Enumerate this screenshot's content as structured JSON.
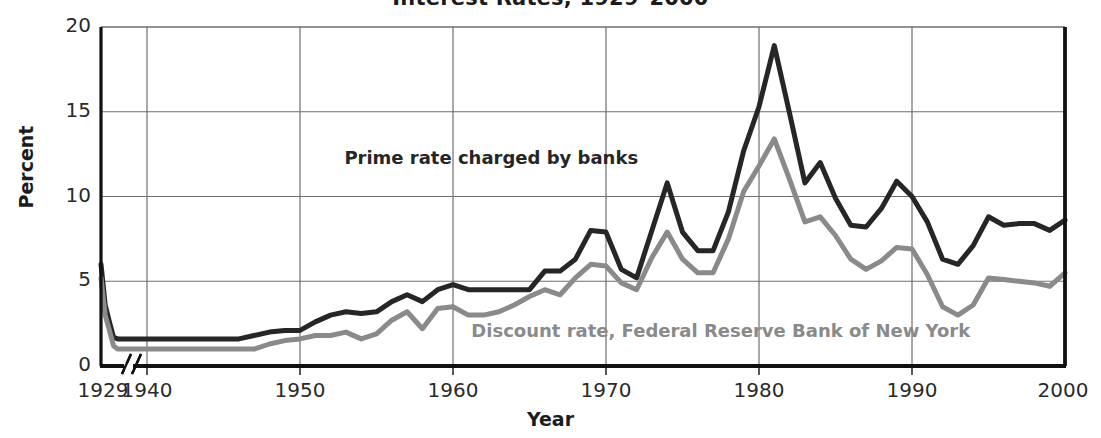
{
  "chart_data": {
    "type": "line",
    "title": "Interest Rates, 1929–2000",
    "xlabel": "Year",
    "ylabel": "Percent",
    "ylim": [
      0,
      20
    ],
    "xlim": [
      1929,
      2000
    ],
    "grid": true,
    "axis_break": true,
    "axis_break_note": "//",
    "legend_position": "inline-annotations",
    "y_ticks": [
      0,
      5,
      10,
      15,
      20
    ],
    "y_tick_labels": [
      "0",
      "5",
      "10",
      "15",
      "20"
    ],
    "x_ticks": [
      1929,
      1940,
      1950,
      1960,
      1970,
      1980,
      1990,
      2000
    ],
    "x_tick_labels": [
      "1929",
      "1940",
      "1950",
      "1960",
      "1970",
      "1980",
      "1990",
      "2000"
    ],
    "colors": {
      "prime": "#262626",
      "discount": "#8a8a8a",
      "grid": "#6e6e6e",
      "axis": "#111111"
    },
    "series": [
      {
        "name": "Prime rate charged by banks",
        "color": "#262626",
        "label_x": 1962.5,
        "label_y": 12.2,
        "x": [
          1929,
          1930,
          1931,
          1932,
          1933,
          1934,
          1940,
          1941,
          1942,
          1943,
          1944,
          1945,
          1946,
          1947,
          1948,
          1949,
          1950,
          1951,
          1952,
          1953,
          1954,
          1955,
          1956,
          1957,
          1958,
          1959,
          1960,
          1961,
          1962,
          1963,
          1964,
          1965,
          1966,
          1967,
          1968,
          1969,
          1970,
          1971,
          1972,
          1973,
          1974,
          1975,
          1976,
          1977,
          1978,
          1979,
          1980,
          1981,
          1982,
          1983,
          1984,
          1985,
          1986,
          1987,
          1988,
          1989,
          1990,
          1991,
          1992,
          1993,
          1994,
          1995,
          1996,
          1997,
          1998,
          1999,
          2000
        ],
        "y": [
          6.0,
          3.6,
          2.6,
          1.7,
          1.6,
          1.6,
          1.6,
          1.6,
          1.6,
          1.6,
          1.6,
          1.6,
          1.6,
          1.8,
          2.0,
          2.1,
          2.1,
          2.6,
          3.0,
          3.2,
          3.1,
          3.2,
          3.8,
          4.2,
          3.8,
          4.5,
          4.8,
          4.5,
          4.5,
          4.5,
          4.5,
          4.5,
          5.6,
          5.6,
          6.3,
          8.0,
          7.9,
          5.7,
          5.2,
          8.0,
          10.8,
          7.9,
          6.8,
          6.8,
          9.1,
          12.7,
          15.3,
          18.9,
          14.9,
          10.8,
          12.0,
          9.9,
          8.3,
          8.2,
          9.3,
          10.9,
          10.0,
          8.5,
          6.3,
          6.0,
          7.1,
          8.8,
          8.3,
          8.4,
          8.4,
          8.0,
          8.6
        ]
      },
      {
        "name": "Discount rate, Federal Reserve Bank of New York",
        "color": "#8a8a8a",
        "label_x": 1977.5,
        "label_y": 2.0,
        "x": [
          1929,
          1930,
          1931,
          1932,
          1933,
          1934,
          1940,
          1941,
          1942,
          1943,
          1944,
          1945,
          1946,
          1947,
          1948,
          1949,
          1950,
          1951,
          1952,
          1953,
          1954,
          1955,
          1956,
          1957,
          1958,
          1959,
          1960,
          1961,
          1962,
          1963,
          1964,
          1965,
          1966,
          1967,
          1968,
          1969,
          1970,
          1971,
          1972,
          1973,
          1974,
          1975,
          1976,
          1977,
          1978,
          1979,
          1980,
          1981,
          1982,
          1983,
          1984,
          1985,
          1986,
          1987,
          1988,
          1989,
          1990,
          1991,
          1992,
          1993,
          1994,
          1995,
          1996,
          1997,
          1998,
          1999,
          2000
        ],
        "y": [
          5.2,
          3.0,
          2.1,
          1.2,
          1.0,
          1.0,
          1.0,
          1.0,
          1.0,
          1.0,
          1.0,
          1.0,
          1.0,
          1.0,
          1.3,
          1.5,
          1.6,
          1.8,
          1.8,
          2.0,
          1.6,
          1.9,
          2.7,
          3.2,
          2.2,
          3.4,
          3.5,
          3.0,
          3.0,
          3.2,
          3.6,
          4.1,
          4.5,
          4.2,
          5.2,
          6.0,
          5.9,
          4.9,
          4.5,
          6.4,
          7.9,
          6.3,
          5.5,
          5.5,
          7.5,
          10.3,
          11.8,
          13.4,
          11.0,
          8.5,
          8.8,
          7.7,
          6.3,
          5.7,
          6.2,
          7.0,
          6.9,
          5.4,
          3.5,
          3.0,
          3.6,
          5.2,
          5.1,
          5.0,
          4.9,
          4.7,
          5.5
        ]
      }
    ]
  }
}
